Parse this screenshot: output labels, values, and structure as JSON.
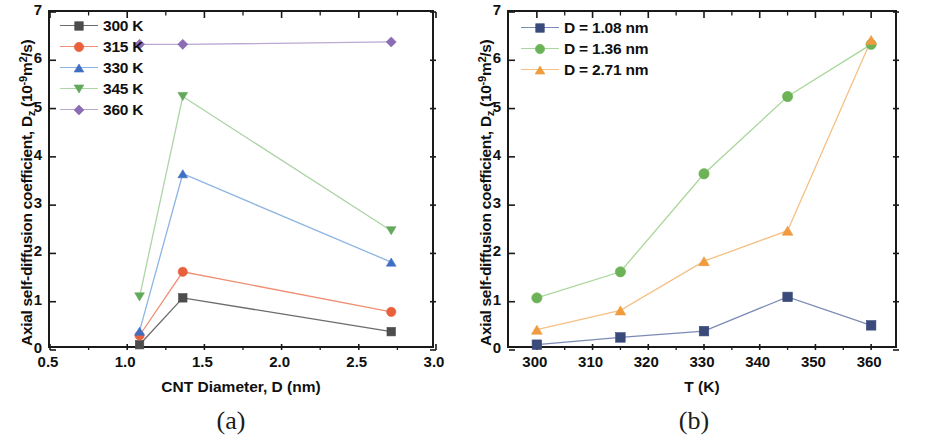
{
  "figure": {
    "panels": [
      {
        "caption": "(a)",
        "ylabel_main": "Axial self-diffusion coefficient, D",
        "ylabel_sub": "z",
        "ylabel_unit_open": " (10",
        "ylabel_unit_exp": "-9",
        "ylabel_unit_close": "m",
        "ylabel_unit_sq": "2",
        "ylabel_unit_end": "/s)",
        "xlabel": "CNT Diameter, D (nm)",
        "ytick_labels": [
          "0",
          "1",
          "2",
          "3",
          "4",
          "5",
          "6",
          "7"
        ],
        "xtick_labels": [
          "0.5",
          "1.0",
          "1.5",
          "2.0",
          "2.5",
          "3.0"
        ]
      },
      {
        "caption": "(b)",
        "ylabel_main": "Axial self-diffusion coefficient, D",
        "ylabel_sub": "z",
        "ylabel_unit_open": " (10",
        "ylabel_unit_exp": "-9",
        "ylabel_unit_close": "m",
        "ylabel_unit_sq": "2",
        "ylabel_unit_end": "/s)",
        "xlabel": "T (K)",
        "ytick_labels": [
          "0",
          "1",
          "2",
          "3",
          "4",
          "5",
          "6",
          "7"
        ],
        "xtick_labels": [
          "300",
          "310",
          "320",
          "330",
          "340",
          "350",
          "360"
        ]
      }
    ]
  },
  "chart_data": [
    {
      "type": "line",
      "panel": "(a)",
      "title": "",
      "xlabel": "CNT Diameter, D (nm)",
      "ylabel": "Axial self-diffusion coefficient, Dz (10^-9 m^2/s)",
      "xlim": [
        0.5,
        3.0
      ],
      "ylim": [
        0,
        7
      ],
      "xticks": [
        0.5,
        1.0,
        1.5,
        2.0,
        2.5,
        3.0
      ],
      "yticks": [
        0,
        1,
        2,
        3,
        4,
        5,
        6,
        7
      ],
      "grid": false,
      "legend_position": "top-left",
      "x": [
        1.08,
        1.36,
        2.71
      ],
      "series": [
        {
          "name": "300 K",
          "values": [
            0.11,
            1.08,
            0.38
          ],
          "color": "#4d4d4d",
          "line_color": "#6b6b6b",
          "marker": "square"
        },
        {
          "name": "315 K",
          "values": [
            0.3,
            1.62,
            0.79
          ],
          "color": "#e8603c",
          "line_color": "#ef8f74",
          "marker": "circle"
        },
        {
          "name": "330 K",
          "values": [
            0.39,
            3.65,
            1.82
          ],
          "color": "#3f6fc4",
          "line_color": "#8eb4e3",
          "marker": "triangle-up"
        },
        {
          "name": "345 K",
          "values": [
            1.1,
            5.25,
            2.47
          ],
          "color": "#62a95c",
          "line_color": "#aed4a8",
          "marker": "triangle-down"
        },
        {
          "name": "360 K",
          "values": [
            6.33,
            6.33,
            6.38
          ],
          "color": "#8c6cb5",
          "line_color": "#bba9d4",
          "marker": "diamond"
        }
      ]
    },
    {
      "type": "line",
      "panel": "(b)",
      "title": "",
      "xlabel": "T (K)",
      "ylabel": "Axial self-diffusion coefficient, Dz (10^-9 m^2/s)",
      "xlim": [
        295,
        365
      ],
      "ylim": [
        0,
        7
      ],
      "xticks": [
        300,
        310,
        320,
        330,
        340,
        350,
        360
      ],
      "yticks": [
        0,
        1,
        2,
        3,
        4,
        5,
        6,
        7
      ],
      "grid": false,
      "legend_position": "top-left",
      "x": [
        300,
        315,
        330,
        345,
        360
      ],
      "series": [
        {
          "name": "D = 1.08 nm",
          "values": [
            0.11,
            0.26,
            0.39,
            1.1,
            0.51
          ],
          "color": "#3a4a7a",
          "line_color": "#7b8bb5",
          "marker": "square"
        },
        {
          "name": "D = 1.36 nm",
          "values": [
            1.08,
            1.62,
            3.65,
            5.25,
            6.33
          ],
          "color": "#6cb257",
          "line_color": "#a9d79b",
          "marker": "circle"
        },
        {
          "name": "D = 2.71 nm",
          "values": [
            0.42,
            0.82,
            1.84,
            2.47,
            6.42
          ],
          "color": "#ef9b3e",
          "line_color": "#f5c086",
          "marker": "triangle-up"
        }
      ]
    }
  ]
}
